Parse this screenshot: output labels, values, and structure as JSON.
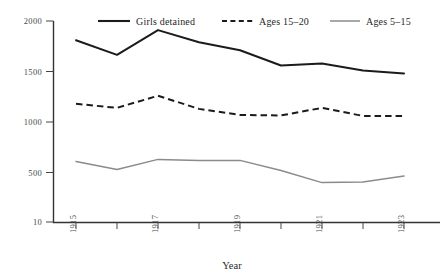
{
  "chart_data": {
    "type": "line",
    "title": "",
    "xlabel": "Year",
    "ylabel": "",
    "x": [
      1915,
      1916,
      1917,
      1918,
      1919,
      1920,
      1921,
      1922,
      1923
    ],
    "xtick_values": [
      1915,
      1917,
      1919,
      1921,
      1923
    ],
    "xtick_labels": [
      "1915",
      "1917",
      "1919",
      "1921",
      "1923"
    ],
    "xlim": [
      1915,
      1923
    ],
    "ylim": [
      10,
      2000
    ],
    "ytick_values": [
      10,
      500,
      1000,
      1500,
      2000
    ],
    "ytick_labels": [
      "10",
      "500",
      "1000",
      "1500",
      "2000"
    ],
    "grid": false,
    "legend_position": "top",
    "series": [
      {
        "name": "Girls detained",
        "style": "solid-thick",
        "color": "#1b1b1b",
        "values": [
          1810,
          1665,
          1910,
          1790,
          1710,
          1560,
          1580,
          1510,
          1480
        ]
      },
      {
        "name": "Ages 15–20",
        "style": "dashed",
        "color": "#1b1b1b",
        "values": [
          1180,
          1140,
          1260,
          1130,
          1070,
          1065,
          1140,
          1060,
          1060
        ]
      },
      {
        "name": "Ages 5–15",
        "style": "solid-thin",
        "color": "#8b8b8b",
        "values": [
          610,
          530,
          630,
          620,
          620,
          520,
          400,
          405,
          465
        ]
      }
    ]
  },
  "legend": {
    "items": [
      {
        "label": "Girls detained"
      },
      {
        "label": "Ages 15–20"
      },
      {
        "label": "Ages 5–15"
      }
    ]
  },
  "axes": {
    "x_axis_title": "Year"
  }
}
